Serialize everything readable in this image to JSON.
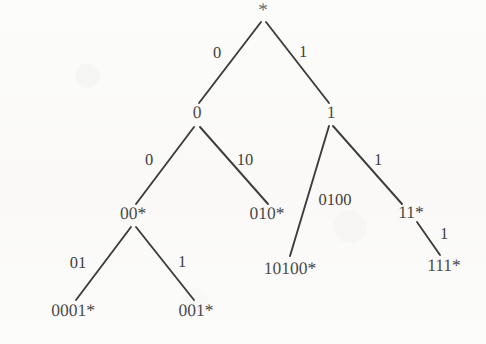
{
  "diagram": {
    "type": "tree",
    "background_color": "#fbfbf9",
    "stroke_color": "#3d3d3d",
    "text_color": "#4a4a4a",
    "nodes": [
      {
        "id": "root",
        "label": "*",
        "x": 263,
        "y": 10
      },
      {
        "id": "n0",
        "label": "0",
        "x": 197,
        "y": 113
      },
      {
        "id": "n1",
        "label": "1",
        "x": 331,
        "y": 113
      },
      {
        "id": "n00",
        "label": "00*",
        "x": 133,
        "y": 214
      },
      {
        "id": "n010",
        "label": "010*",
        "x": 267,
        "y": 214
      },
      {
        "id": "n10100",
        "label": "10100*",
        "x": 290,
        "y": 269
      },
      {
        "id": "n11",
        "label": "11*",
        "x": 411,
        "y": 213
      },
      {
        "id": "n111",
        "label": "111*",
        "x": 444,
        "y": 266
      },
      {
        "id": "n0001",
        "label": "0001*",
        "x": 73,
        "y": 311
      },
      {
        "id": "n001",
        "label": "001*",
        "x": 196,
        "y": 311
      }
    ],
    "edges": [
      {
        "from": "root",
        "to": "n0",
        "label": "0",
        "lx": 217,
        "ly": 53,
        "x1": 261,
        "y1": 22,
        "x2": 199,
        "y2": 103
      },
      {
        "from": "root",
        "to": "n1",
        "label": "1",
        "lx": 303,
        "ly": 52,
        "x1": 266,
        "y1": 22,
        "x2": 329,
        "y2": 103
      },
      {
        "from": "n0",
        "to": "n00",
        "label": "0",
        "lx": 149,
        "ly": 160,
        "x1": 194,
        "y1": 127,
        "x2": 136,
        "y2": 204
      },
      {
        "from": "n0",
        "to": "n010",
        "label": "10",
        "lx": 245,
        "ly": 160,
        "x1": 200,
        "y1": 127,
        "x2": 268,
        "y2": 204
      },
      {
        "from": "n1",
        "to": "n10100",
        "label": "0100",
        "lx": 335,
        "ly": 200,
        "x1": 329,
        "y1": 126,
        "x2": 290,
        "y2": 256
      },
      {
        "from": "n1",
        "to": "n11",
        "label": "1",
        "lx": 378,
        "ly": 160,
        "x1": 333,
        "y1": 126,
        "x2": 402,
        "y2": 204
      },
      {
        "from": "n11",
        "to": "n111",
        "label": "1",
        "lx": 444,
        "ly": 234,
        "x1": 417,
        "y1": 222,
        "x2": 440,
        "y2": 255
      },
      {
        "from": "n00",
        "to": "n0001",
        "label": "01",
        "lx": 78,
        "ly": 263,
        "x1": 131,
        "y1": 227,
        "x2": 76,
        "y2": 300
      },
      {
        "from": "n00",
        "to": "n001",
        "label": "1",
        "lx": 182,
        "ly": 262,
        "x1": 136,
        "y1": 227,
        "x2": 194,
        "y2": 300
      }
    ]
  }
}
